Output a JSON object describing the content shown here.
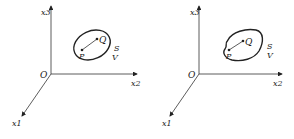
{
  "diagrams": [
    {
      "name": "left",
      "region_shape": "ellipse",
      "labels": {
        "x3": "x3",
        "x2": "x2",
        "x1": "x1",
        "origin": "O",
        "P": "P",
        "Q": "Q",
        "S": "S",
        "V": "V"
      }
    },
    {
      "name": "right",
      "region_shape": "irregular",
      "labels": {
        "x3": "x3",
        "x2": "x2",
        "x1": "x1",
        "origin": "O",
        "P": "P",
        "Q": "Q",
        "S": "S",
        "V": "V"
      }
    }
  ],
  "colors": {
    "stroke": "#222222",
    "background": "#ffffff"
  }
}
